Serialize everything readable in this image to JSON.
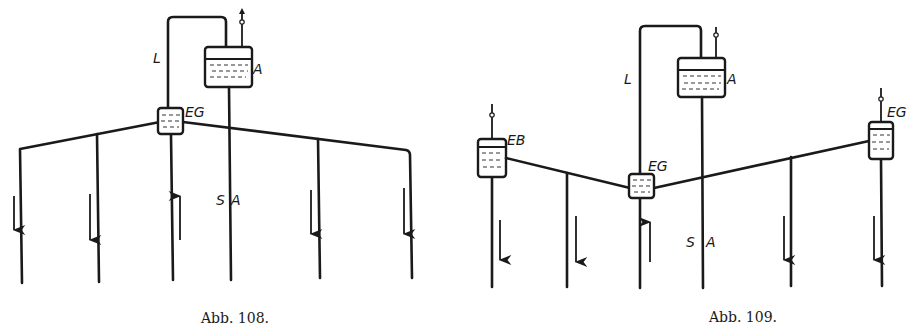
{
  "figures": [
    {
      "caption": "Abb. 108.",
      "labels": {
        "loop_line": "L",
        "tank": "A",
        "central_vessel": "EG",
        "supply_label_s": "S",
        "supply_label_a": "A"
      }
    },
    {
      "caption": "Abb. 109.",
      "labels": {
        "loop_line": "L",
        "tank": "A",
        "left_vessel": "EB",
        "central_vessel": "EG",
        "right_vessel": "EG",
        "supply_label_s": "S",
        "supply_label_a": "A"
      }
    }
  ],
  "colors": {
    "ink": "#1a1a1a",
    "paper": "#ffffff"
  }
}
